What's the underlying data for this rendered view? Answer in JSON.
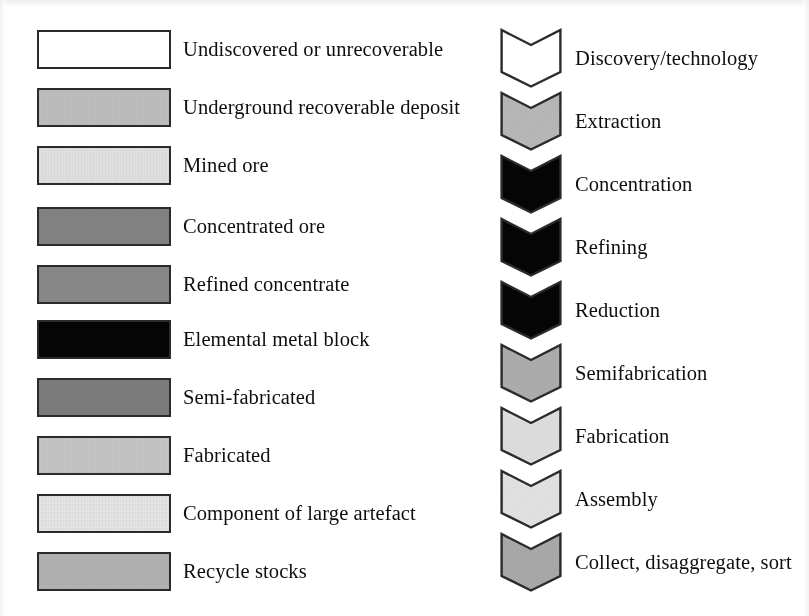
{
  "figure": {
    "kind": "legend-key",
    "background_color": "#ffffff",
    "outline_color": "#2b2b2b",
    "text_color": "#0e0e0e"
  },
  "materials": {
    "column_name": "material-stock-legend",
    "items": [
      {
        "label": "Undiscovered or unrecoverable",
        "fill": "#ffffff",
        "swatch_name": "swatch-undiscovered-or-unrecoverable",
        "top": 30
      },
      {
        "label": "Underground recoverable deposit",
        "fill": "#bfbfbf",
        "swatch_name": "swatch-underground-recoverable-deposit",
        "top": 88
      },
      {
        "label": "Mined ore",
        "fill": "#e2e2e2",
        "swatch_name": "swatch-mined-ore",
        "top": 146
      },
      {
        "label": "Concentrated ore",
        "fill": "#848484",
        "swatch_name": "swatch-concentrated-ore",
        "top": 207
      },
      {
        "label": "Refined concentrate",
        "fill": "#8a8a8a",
        "swatch_name": "swatch-refined-concentrate",
        "top": 265
      },
      {
        "label": "Elemental metal block",
        "fill": "#050505",
        "swatch_name": "swatch-elemental-metal-block",
        "top": 320
      },
      {
        "label": "Semi-fabricated",
        "fill": "#7e7e7e",
        "swatch_name": "swatch-semi-fabricated",
        "top": 378
      },
      {
        "label": "Fabricated",
        "fill": "#c6c6c6",
        "swatch_name": "swatch-fabricated",
        "top": 436
      },
      {
        "label": "Component of large artefact",
        "fill": "#e6e6e6",
        "swatch_name": "swatch-component-of-large-artefact",
        "top": 494
      },
      {
        "label": "Recycle stocks",
        "fill": "#b4b4b4",
        "swatch_name": "swatch-recycle-stocks",
        "top": 552
      }
    ]
  },
  "processes": {
    "column_name": "process-step-legend",
    "items": [
      {
        "label": "Discovery/technology",
        "fill": "#ffffff",
        "chevron_name": "chevron-discovery-technology",
        "top": 28
      },
      {
        "label": "Extraction",
        "fill": "#b9b9b9",
        "chevron_name": "chevron-extraction",
        "top": 91
      },
      {
        "label": "Concentration",
        "fill": "#050505",
        "chevron_name": "chevron-concentration",
        "top": 154
      },
      {
        "label": "Refining",
        "fill": "#050505",
        "chevron_name": "chevron-refining",
        "top": 217
      },
      {
        "label": "Reduction",
        "fill": "#050505",
        "chevron_name": "chevron-reduction",
        "top": 280
      },
      {
        "label": "Semifabrication",
        "fill": "#aeaeae",
        "chevron_name": "chevron-semifabrication",
        "top": 343
      },
      {
        "label": "Fabrication",
        "fill": "#e0e0e0",
        "chevron_name": "chevron-fabrication",
        "top": 406
      },
      {
        "label": "Assembly",
        "fill": "#e4e4e4",
        "chevron_name": "chevron-assembly",
        "top": 469
      },
      {
        "label": "Collect, disaggregate, sort",
        "fill": "#aaaaaa",
        "chevron_name": "chevron-collect-disaggregate-sort",
        "top": 532
      }
    ]
  }
}
